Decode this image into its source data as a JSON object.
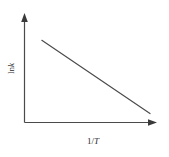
{
  "figure": {
    "background_color": "#ffffff",
    "ink_color": "#3a3a3a",
    "line_color": "#4a4a4a"
  },
  "axes": {
    "x": {
      "label_prefix": "1/",
      "label_variable": "T",
      "label_full": "1/T",
      "arrow": "right-arrowhead"
    },
    "y": {
      "label_prefix": "ln",
      "label_variable": "k",
      "label_full": "ln k",
      "arrow": "up-arrowhead"
    }
  },
  "chart_data": {
    "type": "line",
    "title": "",
    "subtitle": "",
    "xlabel": "1/T",
    "ylabel": "ln k",
    "grid": false,
    "legend": false,
    "legend_position": "none",
    "xlim": [
      0,
      1
    ],
    "ylim": [
      0,
      1
    ],
    "x_ticks": [],
    "y_ticks": [],
    "x_tick_labels": [],
    "y_tick_labels": [],
    "annotations": [],
    "series": [
      {
        "name": "ln k vs 1/T",
        "style": "straight-line",
        "slope_sign": "negative",
        "x": [
          0.138,
          1.0
        ],
        "y": [
          0.802,
          0.087
        ]
      }
    ]
  }
}
